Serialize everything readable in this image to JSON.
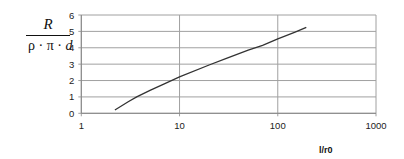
{
  "chart_data": {
    "type": "line",
    "title": "",
    "xlabel": "l/r0",
    "ylabel": "R / (ρ·π·d)",
    "ylabel_numerator": "R",
    "ylabel_denominator": "ρ · π · d",
    "xscale": "log",
    "xlim": [
      1,
      1000
    ],
    "ylim": [
      0,
      6
    ],
    "xticks": [
      "1",
      "10",
      "100",
      "1000"
    ],
    "yticks": [
      "0",
      "1",
      "2",
      "3",
      "4",
      "5",
      "6"
    ],
    "grid": true,
    "legend": null,
    "series": [
      {
        "name": "R/(ρ·π·d)",
        "color": "#333333",
        "x": [
          2.2,
          3,
          3.66,
          5,
          7,
          10,
          20,
          30,
          50,
          70,
          100,
          150,
          195
        ],
        "y": [
          0.2,
          0.7,
          1.0,
          1.4,
          1.8,
          2.23,
          2.95,
          3.35,
          3.85,
          4.15,
          4.55,
          4.95,
          5.25
        ]
      }
    ]
  },
  "labels": {
    "y_numerator": "R",
    "y_den_rho": "ρ",
    "y_den_pi": "π",
    "y_den_d": "d",
    "dot": "·",
    "x_axis_label": "l/r0"
  },
  "colors": {
    "grid": "#a0a0a0",
    "axis": "#888888",
    "curve": "#333333",
    "tick_text": "#222222"
  }
}
